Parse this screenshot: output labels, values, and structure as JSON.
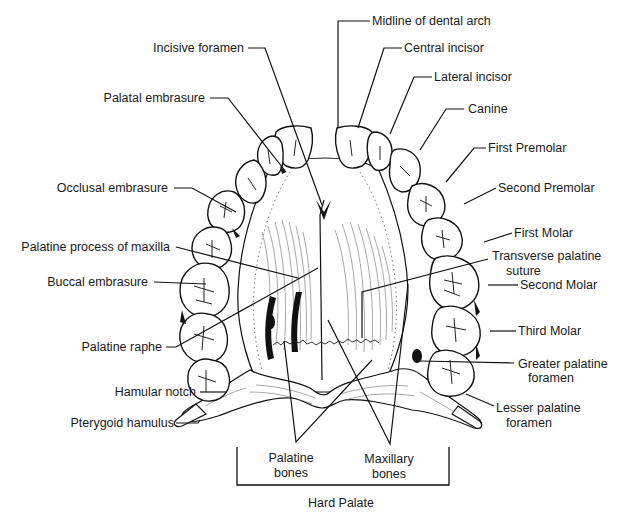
{
  "figure": {
    "title": "Hard Palate"
  },
  "labels": {
    "midline_of_dental_arch": "Midline of dental arch",
    "incisive_foramen": "Incisive foramen",
    "central_incisor": "Central incisor",
    "lateral_incisor": "Lateral incisor",
    "palatal_embrasure": "Palatal embrasure",
    "canine": "Canine",
    "first_premolar": "First Premolar",
    "occlusal_embrasure": "Occlusal embrasure",
    "second_premolar": "Second Premolar",
    "first_molar": "First Molar",
    "palatine_process_of_maxilla": "Palatine process of maxilla",
    "transverse_palatine_suture_line1": "Transverse palatine",
    "transverse_palatine_suture_line2": "suture",
    "buccal_embrasure": "Buccal embrasure",
    "second_molar": "Second Molar",
    "third_molar": "Third Molar",
    "palatine_raphe": "Palatine raphe",
    "greater_palatine_foramen_line1": "Greater palatine",
    "greater_palatine_foramen_line2": "foramen",
    "hamular_notch": "Hamular notch",
    "lesser_palatine_foramen_line1": "Lesser palatine",
    "lesser_palatine_foramen_line2": "foramen",
    "pterygoid_hamulus": "Pterygoid hamulus",
    "palatine_bones_line1": "Palatine",
    "palatine_bones_line2": "bones",
    "maxillary_bones_line1": "Maxillary",
    "maxillary_bones_line2": "bones",
    "hard_palate": "Hard Palate"
  },
  "colors": {
    "ink": "#111111",
    "background": "#ffffff",
    "text": "#1a1a1a"
  }
}
